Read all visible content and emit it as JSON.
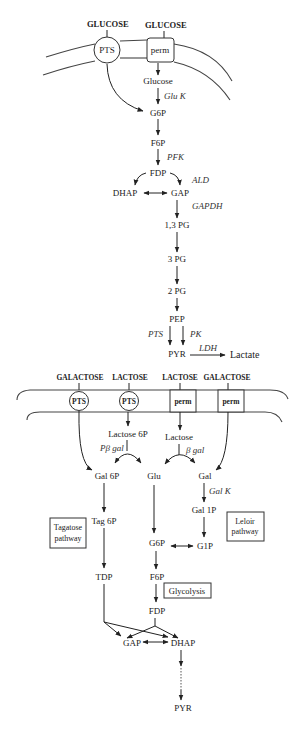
{
  "glucose_uptake": {
    "substrates": [
      "GLUCOSE",
      "GLUCOSE"
    ],
    "transporters": [
      "PTS",
      "perm"
    ]
  },
  "glycolysis": {
    "metabolites": {
      "glucose": "Glucose",
      "g6p": "G6P",
      "f6p": "F6P",
      "fdp": "FDP",
      "dhap": "DHAP",
      "gap": "GAP",
      "pg13": "1,3 PG",
      "pg3": "3 PG",
      "pg2": "2 PG",
      "pep": "PEP",
      "pyr": "PYR",
      "lactate": "Lactate"
    },
    "enzymes": {
      "gluk": "Glu K",
      "pfk": "PFK",
      "ald": "ALD",
      "gapdh": "GAPDH",
      "pts": "PTS",
      "pk": "PK",
      "ldh": "LDH"
    }
  },
  "lactose_galactose_uptake": {
    "substrates": [
      "GALACTOSE",
      "LACTOSE",
      "LACTOSE",
      "GALACTOSE"
    ],
    "transporters": [
      "PTS",
      "PTS",
      "perm",
      "perm"
    ]
  },
  "lower_pathways": {
    "metabolites": {
      "lactose6p": "Lactose 6P",
      "lactose": "Lactose",
      "gal6p": "Gal 6P",
      "glu": "Glu",
      "gal": "Gal",
      "gal1p": "Gal 1P",
      "tag6p": "Tag 6P",
      "g6p": "G6P",
      "g1p": "G1P",
      "tdp": "TDP",
      "f6p": "F6P",
      "fdp": "FDP",
      "gap": "GAP",
      "dhap": "DHAP",
      "pyr": "PYR"
    },
    "enzymes": {
      "pbgal": "Pβ gal",
      "bgal": "β gal",
      "galk": "Gal K"
    },
    "pathway_boxes": {
      "tagatose": [
        "Tagatose",
        "pathway"
      ],
      "leloir": [
        "Leloir",
        "pathway"
      ],
      "glycolysis": "Glycolysis"
    }
  }
}
